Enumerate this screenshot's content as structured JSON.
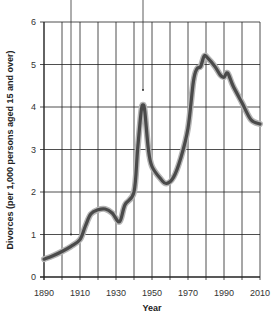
{
  "chart_data": {
    "type": "line",
    "title": "",
    "xlabel": "Year",
    "ylabel": "Divorces (per 1,000 persons aged 15 and over)",
    "xlim": [
      1890,
      2010
    ],
    "ylim": [
      0,
      6
    ],
    "x_ticks": [
      "1890",
      "1910",
      "1930",
      "1950",
      "1970",
      "1990",
      "2010"
    ],
    "y_ticks": [
      "0",
      "1",
      "2",
      "3",
      "4",
      "5",
      "6"
    ],
    "grid": true,
    "legend": null,
    "series": [
      {
        "name": "Divorce rate",
        "x": [
          1890,
          1895,
          1900,
          1905,
          1910,
          1913,
          1916,
          1920,
          1924,
          1928,
          1932,
          1935,
          1940,
          1942,
          1944,
          1945,
          1946,
          1948,
          1950,
          1955,
          1958,
          1962,
          1966,
          1970,
          1973,
          1975,
          1977,
          1979,
          1981,
          1985,
          1988,
          1990,
          1992,
          1995,
          2000,
          2005,
          2010
        ],
        "values": [
          0.42,
          0.5,
          0.6,
          0.72,
          0.88,
          1.2,
          1.48,
          1.58,
          1.6,
          1.5,
          1.3,
          1.7,
          2.0,
          3.0,
          3.9,
          4.05,
          3.9,
          3.0,
          2.6,
          2.3,
          2.2,
          2.35,
          2.8,
          3.5,
          4.6,
          4.9,
          4.95,
          5.2,
          5.15,
          4.95,
          4.75,
          4.7,
          4.8,
          4.5,
          4.1,
          3.7,
          3.6
        ]
      }
    ],
    "annotations": [
      {
        "type": "pointer-line",
        "x": 1905,
        "y_end": 1.0
      },
      {
        "type": "pointer-line",
        "x": 1945,
        "y_end": 4.4
      }
    ],
    "style": {
      "line_color": "#4a4a4a",
      "line_halo": "#b5b5b5",
      "grid_color": "#222222"
    }
  }
}
